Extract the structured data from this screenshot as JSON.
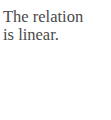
{
  "text": {
    "lines": [
      "The relation",
      "is linear."
    ]
  },
  "colors": {
    "background": "#ffffff",
    "text": "#4a4a4a"
  }
}
